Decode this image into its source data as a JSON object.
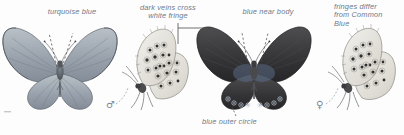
{
  "plate": {
    "title": "Butterfly identification plate",
    "background_color": "#fdfdfd",
    "label_color": "#6b7a8d",
    "ink_color": "#4a4a4a",
    "width": 404,
    "height": 135
  },
  "annotations": [
    {
      "id": "turquoise-blue",
      "text": "turquoise blue",
      "lines": [
        "turquoise blue"
      ],
      "align": "center",
      "leader": "dashed-v",
      "points_to": "male-upperside-wing"
    },
    {
      "id": "dark-veins-white-fringe",
      "text": "dark veins cross\nwhite fringe",
      "lines": [
        "dark veins cross",
        "white fringe"
      ],
      "align": "center",
      "leader": "elbow",
      "points_to": "male-underside-forewing-margin"
    },
    {
      "id": "blue-near-body",
      "text": "blue near body",
      "lines": [
        "blue near body"
      ],
      "align": "center",
      "leader": "dashed-v",
      "points_to": "female-upperside-wing-base"
    },
    {
      "id": "fringes-differ",
      "text": "fringes differ\nfrom Common\nBlue",
      "lines": [
        "fringes differ",
        "from Common",
        "Blue"
      ],
      "align": "left",
      "leader": "none",
      "points_to": "female-underside-fringe"
    },
    {
      "id": "blue-outer-circle",
      "text": "blue outer circle",
      "lines": [
        "blue outer circle"
      ],
      "align": "left",
      "leader": "none",
      "points_to": "female-upperside-hindwing-spots"
    }
  ],
  "sex_symbols": [
    {
      "id": "male",
      "glyph": "♂",
      "name": "male-symbol",
      "subject": "male-underside"
    },
    {
      "id": "female",
      "glyph": "♀",
      "name": "female-symbol",
      "subject": "female-underside"
    }
  ],
  "figures": [
    {
      "id": "male-upperside",
      "name": "male-upperside-figure",
      "view": "upperside",
      "sex": "male",
      "wing_tone": "#9aa3ad"
    },
    {
      "id": "male-underside",
      "name": "male-underside-figure",
      "view": "underside",
      "sex": "male",
      "wing_tone": "#e6e6e2"
    },
    {
      "id": "female-upperside",
      "name": "female-upperside-figure",
      "view": "upperside",
      "sex": "female",
      "wing_tone": "#3b3b3d"
    },
    {
      "id": "female-underside",
      "name": "female-underside-figure",
      "view": "underside",
      "sex": "female",
      "wing_tone": "#e6e6e2"
    }
  ]
}
